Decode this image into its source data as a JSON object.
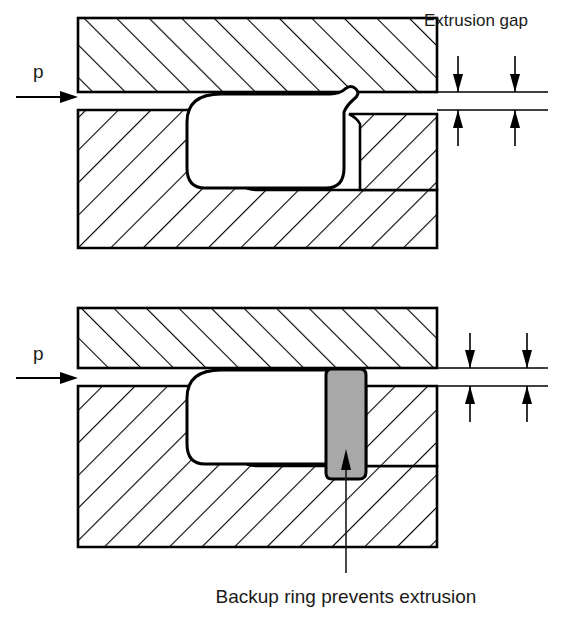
{
  "figure": {
    "background_color": "#ffffff",
    "line_color": "#000000"
  },
  "annotations": {
    "extrusion_gap_label": "Extrusion gap",
    "backup_ring_caption": "Backup ring prevents extrusion",
    "pressure_symbol_top": "p",
    "pressure_symbol_bottom": "p"
  },
  "panels": [
    {
      "id": "upper-panel",
      "name": "seal-without-backup-ring",
      "description": "O-ring extruded into clearance gap",
      "has_backup_ring": false
    },
    {
      "id": "lower-panel",
      "name": "seal-with-backup-ring",
      "description": "Backup ring fills the clearance gap and blocks extrusion",
      "has_backup_ring": true
    }
  ],
  "parts": {
    "upper_housing_label": "upper-housing-block",
    "lower_housing_left_label": "lower-housing-left-block",
    "lower_housing_right_label": "lower-housing-right-block",
    "base_block_label": "base-block",
    "seal_label": "o-ring-seal",
    "backup_ring_label": "backup-ring",
    "gap_label": "clearance-gap"
  },
  "colors": {
    "backup_ring_fill": "#a8a8a8",
    "seal_fill": "#ffffff",
    "metal_fill": "#ffffff",
    "hatch_stroke": "#000000",
    "outline_stroke": "#000000",
    "text": "#1a1a1a"
  },
  "geometry": {
    "upper_panel": {
      "top_block": {
        "x": 78,
        "y": 18,
        "width": 359,
        "height": 74
      },
      "gap_top_y": 92,
      "gap_bottom_y": 110,
      "gap_right_extension_x": 548,
      "bottom_assembly": {
        "x": 78,
        "y": 110,
        "width": 359,
        "height": 138
      }
    },
    "lower_panel": {
      "top_block": {
        "x": 78,
        "y": 308,
        "width": 359,
        "height": 60
      },
      "gap_top_y": 368,
      "gap_bottom_y": 386,
      "gap_right_extension_x": 548,
      "bottom_assembly": {
        "x": 78,
        "y": 386,
        "width": 359,
        "height": 161
      },
      "backup_ring": {
        "x": 326,
        "y": 369,
        "width": 40,
        "height": 110
      }
    }
  }
}
